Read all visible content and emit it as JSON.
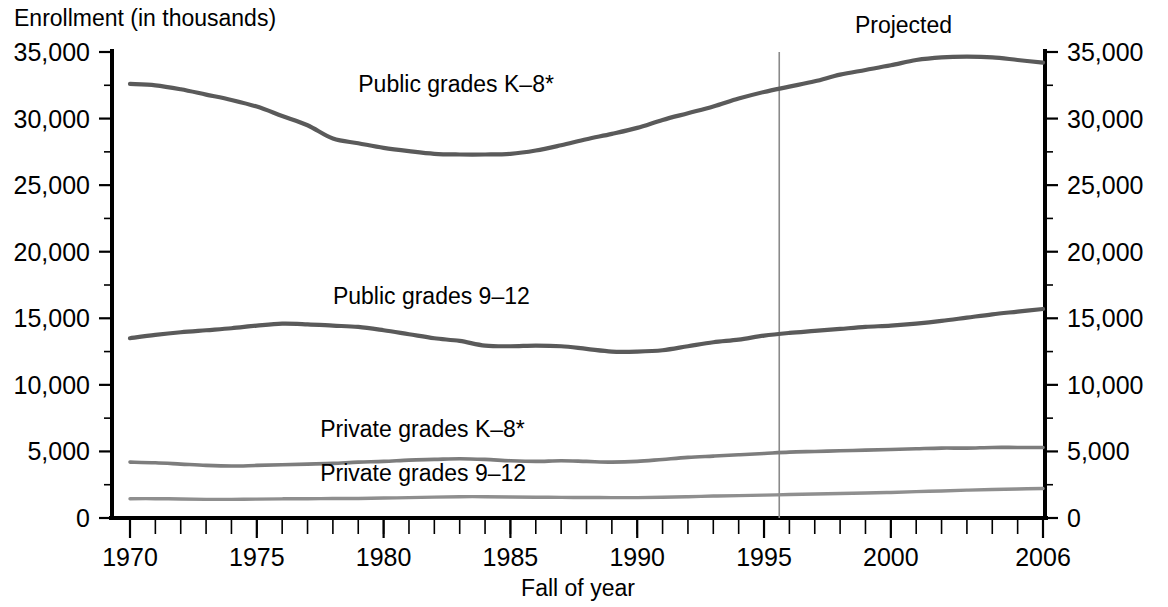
{
  "chart_data": {
    "type": "line",
    "title": "Enrollment (in thousands)",
    "xlabel": "Fall of year",
    "ylabel": "Enrollment (in thousands)",
    "xlim": [
      1970,
      2006
    ],
    "ylim": [
      0,
      35000
    ],
    "grid": false,
    "legend_position": "inline-series-labels",
    "x_tick_labels": [
      "1970",
      "1975",
      "1980",
      "1985",
      "1990",
      "1995",
      "2000",
      "2006"
    ],
    "x_tick_values": [
      1970,
      1975,
      1980,
      1985,
      1990,
      1995,
      2000,
      2006
    ],
    "x_minor_tick_step": 1,
    "y_tick_labels": [
      "0",
      "5,000",
      "10,000",
      "15,000",
      "20,000",
      "25,000",
      "30,000",
      "35,000"
    ],
    "y_tick_values": [
      0,
      5000,
      10000,
      15000,
      20000,
      25000,
      30000,
      35000
    ],
    "y_minor_tick_step": 2500,
    "right_axis_tick_labels": [
      "0",
      "5,000",
      "10,000",
      "15,000",
      "20,000",
      "25,000",
      "30,000",
      "35,000"
    ],
    "annotations": [
      {
        "name": "projected-label",
        "text": "Projected",
        "x": 2000.5,
        "y": 36400
      }
    ],
    "projection_divider": {
      "x": 1995.6,
      "label": "Projected",
      "color": "#8a8a8a"
    },
    "series": [
      {
        "name": "Public grades K–8*",
        "label": "Public grades K–8*",
        "color": "#5a5a5a",
        "width": 4.2,
        "label_x": 1979.0,
        "label_y": 32000,
        "x": [
          1970,
          1971,
          1972,
          1973,
          1974,
          1975,
          1976,
          1977,
          1978,
          1979,
          1980,
          1981,
          1982,
          1983,
          1984,
          1985,
          1986,
          1987,
          1988,
          1989,
          1990,
          1991,
          1992,
          1993,
          1994,
          1995,
          1996,
          1997,
          1998,
          1999,
          2000,
          2001,
          2002,
          2003,
          2004,
          2005,
          2006
        ],
        "y": [
          32600,
          32500,
          32200,
          31800,
          31400,
          30900,
          30200,
          29500,
          28500,
          28150,
          27800,
          27550,
          27350,
          27300,
          27300,
          27350,
          27600,
          28000,
          28450,
          28850,
          29300,
          29900,
          30400,
          30900,
          31500,
          32000,
          32400,
          32800,
          33300,
          33650,
          34000,
          34400,
          34600,
          34650,
          34600,
          34400,
          34200
        ],
        "projected_from": 1996
      },
      {
        "name": "Public grades 9–12",
        "label": "Public grades 9–12",
        "color": "#5a5a5a",
        "width": 4.2,
        "label_x": 1978.0,
        "label_y": 16100,
        "x": [
          1970,
          1971,
          1972,
          1973,
          1974,
          1975,
          1976,
          1977,
          1978,
          1979,
          1980,
          1981,
          1982,
          1983,
          1984,
          1985,
          1986,
          1987,
          1988,
          1989,
          1990,
          1991,
          1992,
          1993,
          1994,
          1995,
          1996,
          1997,
          1998,
          1999,
          2000,
          2001,
          2002,
          2003,
          2004,
          2005,
          2006
        ],
        "y": [
          13500,
          13750,
          13950,
          14100,
          14250,
          14450,
          14600,
          14550,
          14450,
          14350,
          14100,
          13800,
          13500,
          13300,
          12950,
          12900,
          12950,
          12900,
          12700,
          12500,
          12500,
          12600,
          12900,
          13200,
          13400,
          13700,
          13900,
          14050,
          14200,
          14350,
          14450,
          14600,
          14800,
          15050,
          15300,
          15500,
          15700
        ],
        "projected_from": 1996
      },
      {
        "name": "Private grades K–8*",
        "label": "Private grades K–8*",
        "color": "#7d7d7d",
        "width": 3.6,
        "label_x": 1977.5,
        "label_y": 6050,
        "x": [
          1970,
          1971,
          1972,
          1973,
          1974,
          1975,
          1976,
          1977,
          1978,
          1979,
          1980,
          1981,
          1982,
          1983,
          1984,
          1985,
          1986,
          1987,
          1988,
          1989,
          1990,
          1991,
          1992,
          1993,
          1994,
          1995,
          1996,
          1997,
          1998,
          1999,
          2000,
          2001,
          2002,
          2003,
          2004,
          2005,
          2006
        ],
        "y": [
          4200,
          4150,
          4050,
          3950,
          3900,
          3950,
          4000,
          4050,
          4100,
          4200,
          4250,
          4350,
          4400,
          4450,
          4400,
          4300,
          4250,
          4300,
          4250,
          4200,
          4250,
          4400,
          4550,
          4650,
          4750,
          4850,
          4950,
          5000,
          5050,
          5100,
          5150,
          5200,
          5250,
          5250,
          5300,
          5300,
          5300
        ],
        "projected_from": 1996
      },
      {
        "name": "Private grades 9–12",
        "label": "Private grades 9–12",
        "color": "#8f8f8f",
        "width": 3.4,
        "label_x": 1977.5,
        "label_y": 2750,
        "x": [
          1970,
          1971,
          1972,
          1973,
          1974,
          1975,
          1976,
          1977,
          1978,
          1979,
          1980,
          1981,
          1982,
          1983,
          1984,
          1985,
          1986,
          1987,
          1988,
          1989,
          1990,
          1991,
          1992,
          1993,
          1994,
          1995,
          1996,
          1997,
          1998,
          1999,
          2000,
          2001,
          2002,
          2003,
          2004,
          2005,
          2006
        ],
        "y": [
          1450,
          1450,
          1430,
          1400,
          1400,
          1420,
          1440,
          1450,
          1460,
          1470,
          1500,
          1530,
          1570,
          1600,
          1600,
          1580,
          1560,
          1550,
          1540,
          1530,
          1530,
          1560,
          1600,
          1650,
          1680,
          1720,
          1760,
          1800,
          1840,
          1880,
          1920,
          1980,
          2030,
          2090,
          2140,
          2180,
          2220
        ],
        "projected_from": 1996
      }
    ]
  },
  "geometry": {
    "plot_left": 112,
    "plot_right": 1045,
    "plot_top": 52,
    "plot_bottom": 518,
    "data_left": 130,
    "data_right": 1043
  }
}
